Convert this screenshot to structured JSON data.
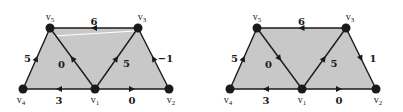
{
  "diagrams": [
    {
      "id": "left",
      "vertices": [
        {
          "name": "v1",
          "label": "v",
          "sub": "1"
        },
        {
          "name": "v2",
          "label": "v",
          "sub": "2"
        },
        {
          "name": "v3",
          "label": "v",
          "sub": "3"
        },
        {
          "name": "v4",
          "label": "v",
          "sub": "4"
        },
        {
          "name": "v5",
          "label": "v",
          "sub": "5"
        }
      ],
      "edges": [
        {
          "from": "v3",
          "to": "v5",
          "weight": "6"
        },
        {
          "from": "v4",
          "to": "v5",
          "weight": "5"
        },
        {
          "from": "v1",
          "to": "v5",
          "weight": "0"
        },
        {
          "from": "v1",
          "to": "v3",
          "weight": "5"
        },
        {
          "from": "v2",
          "to": "v3",
          "weight": "−1"
        },
        {
          "from": "v1",
          "to": "v4",
          "weight": "3"
        },
        {
          "from": "v1",
          "to": "v2",
          "weight": "0"
        }
      ],
      "highlight_line": true
    },
    {
      "id": "right",
      "vertices": [
        {
          "name": "v1",
          "label": "v",
          "sub": "1"
        },
        {
          "name": "v2",
          "label": "v",
          "sub": "2"
        },
        {
          "name": "v3",
          "label": "v",
          "sub": "3"
        },
        {
          "name": "v4",
          "label": "v",
          "sub": "4"
        },
        {
          "name": "v5",
          "label": "v",
          "sub": "5"
        }
      ],
      "edges": [
        {
          "from": "v3",
          "to": "v5",
          "weight": "6"
        },
        {
          "from": "v4",
          "to": "v5",
          "weight": "5"
        },
        {
          "from": "v5",
          "to": "v1",
          "weight": "0"
        },
        {
          "from": "v1",
          "to": "v3",
          "weight": "5"
        },
        {
          "from": "v3",
          "to": "v2",
          "weight": "1"
        },
        {
          "from": "v1",
          "to": "v4",
          "weight": "3"
        },
        {
          "from": "v1",
          "to": "v2",
          "weight": "0"
        }
      ],
      "highlight_line": false
    }
  ]
}
